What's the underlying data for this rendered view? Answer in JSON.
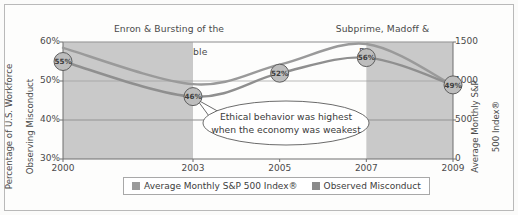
{
  "chart_data": {
    "type": "line",
    "title": "",
    "x": [
      "2000",
      "2003",
      "2005",
      "2007",
      "2009"
    ],
    "xlabel": "",
    "series": [
      {
        "name": "Observed Misconduct",
        "axis": "left",
        "values": [
          55,
          46,
          52,
          56,
          49
        ],
        "unit": "%",
        "point_labels": [
          "55%",
          "46%",
          "52%",
          "56%",
          "49%"
        ],
        "color": "#8f8f8f"
      },
      {
        "name": "Average Monthly S&P 500 Index®",
        "axis": "right",
        "values": [
          1425,
          960,
          1210,
          1475,
          945
        ],
        "color": "#9a9a9a"
      }
    ],
    "left_axis": {
      "label": "Percentage of U.S. Workforce\nObserving Misconduct",
      "ticks": [
        "30%",
        "40%",
        "50%",
        "60%"
      ],
      "ylim": [
        30,
        60
      ]
    },
    "right_axis": {
      "label": "Average Monthly S&P\n500 Index®",
      "ticks": [
        "0",
        "500",
        "1000",
        "1500"
      ],
      "ylim": [
        0,
        1500
      ]
    },
    "grid": true,
    "legend_position": "bottom",
    "shaded_bands": [
      {
        "from": "2000",
        "to": "2003",
        "label": "Enron & Bursting of the\nDot-Com Bubble"
      },
      {
        "from": "2007",
        "to": "2009",
        "label": "Subprime, Madoff &\nRecession"
      }
    ],
    "annotations": [
      {
        "text": "Ethical behavior was highest\nwhen the economy was weakest",
        "line1": "Ethical behavior was highest",
        "line2": "when the economy was weakest",
        "points_to": "2003"
      }
    ]
  },
  "annotations": {
    "left_band_line1": "Enron & Bursting of the",
    "left_band_line2": "Dot-Com Bubble",
    "right_band_line1": "Subprime, Madoff &",
    "right_band_line2": "Recession",
    "callout_line1": "Ethical behavior was highest",
    "callout_line2": "when the economy was weakest"
  },
  "axes": {
    "left_label_line1": "Percentage of U.S. Workforce",
    "left_label_line2": "Observing Misconduct",
    "right_label_line1": "Average Monthly S&P",
    "right_label_line2": "500 Index®",
    "left_ticks": [
      "60%",
      "50%",
      "40%",
      "30%"
    ],
    "right_ticks": [
      "1500",
      "1000",
      "500",
      "0"
    ],
    "x_ticks": [
      "2000",
      "2003",
      "2005",
      "2007",
      "2009"
    ]
  },
  "markers": {
    "p2000": "55%",
    "p2003": "46%",
    "p2005": "52%",
    "p2007": "56%",
    "p2009": "49%"
  },
  "legend": {
    "item1": "Average Monthly S&P 500 Index®",
    "item2": "Observed Misconduct",
    "color1": "#9a9a9a",
    "color2": "#8a8a8a"
  }
}
